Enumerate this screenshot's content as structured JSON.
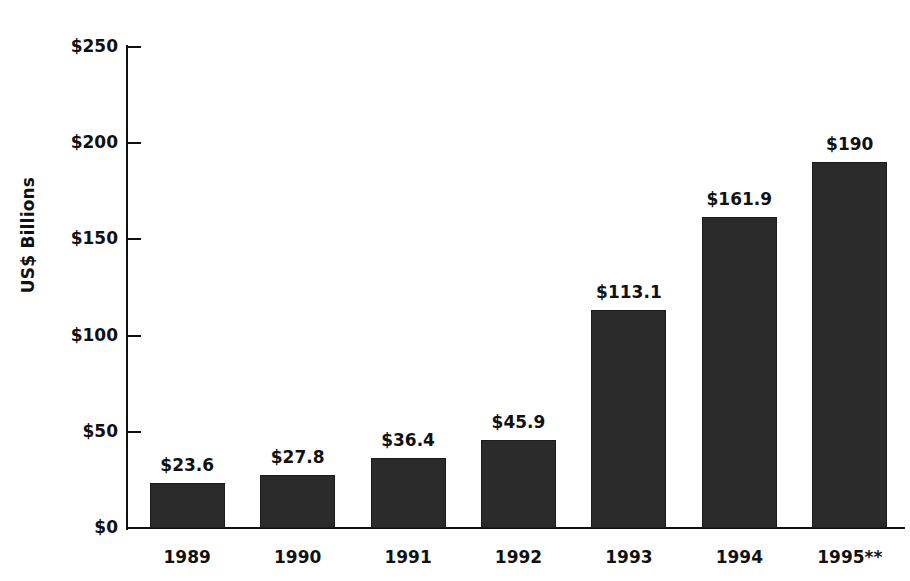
{
  "chart_data": {
    "type": "bar",
    "title": "",
    "subtitle": "",
    "xlabel": "",
    "ylabel": "US$ Billions",
    "categories": [
      "1989",
      "1990",
      "1991",
      "1992",
      "1993",
      "1994",
      "1995**"
    ],
    "values": [
      23.6,
      27.8,
      36.4,
      45.9,
      113.1,
      161.9,
      190
    ],
    "data_labels": [
      "$23.6",
      "$27.8",
      "$36.4",
      "$45.9",
      "$113.1",
      "$161.9",
      "$190"
    ],
    "ylim": [
      0,
      250
    ],
    "ytick_values": [
      0,
      50,
      100,
      150,
      200,
      250
    ],
    "ytick_labels": [
      "$0",
      "$50",
      "$100",
      "$150",
      "$200",
      "$250"
    ],
    "grid": false,
    "legend": null,
    "series": [
      {
        "name": "US$ Billions",
        "values": [
          23.6,
          27.8,
          36.4,
          45.9,
          113.1,
          161.9,
          190
        ]
      }
    ],
    "colors": {
      "bar_fill": "#2b2b2b",
      "bar_stroke": "#1b1b1b",
      "axis": "#111111",
      "text": "#111111",
      "background": "#ffffff"
    }
  }
}
